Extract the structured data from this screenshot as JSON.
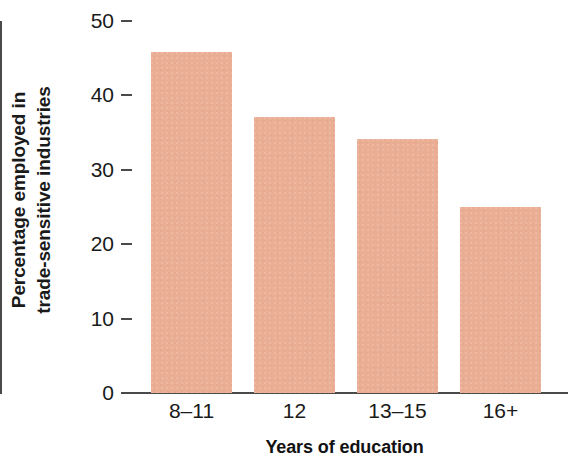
{
  "chart_data": {
    "type": "bar",
    "title": "",
    "subtitle": "",
    "categories": [
      "8–11",
      "12",
      "13–15",
      "16+"
    ],
    "values": [
      45.8,
      37.1,
      34.1,
      25.0
    ],
    "series": [
      {
        "name": "Percentage employed in trade-sensitive industries",
        "values": [
          45.8,
          37.1,
          34.1,
          25.0
        ]
      }
    ],
    "xlabel": "Years of education",
    "ylabel": "Percentage employed in trade-sensitive industries",
    "ylabel_lines": [
      "Percentage employed in",
      "trade-sensitive industries"
    ],
    "ylim": [
      0,
      50
    ],
    "yticks": [
      0,
      10,
      20,
      30,
      40,
      50
    ],
    "ytick_labels": [
      "0",
      "10",
      "20",
      "30",
      "40",
      "50"
    ],
    "grid": false,
    "legend": false,
    "legend_position": "none",
    "bar_color": "#eaae94",
    "axis_color": "#4a4a4a",
    "text_color": "#1a1a1a",
    "background_color": "#ffffff"
  }
}
